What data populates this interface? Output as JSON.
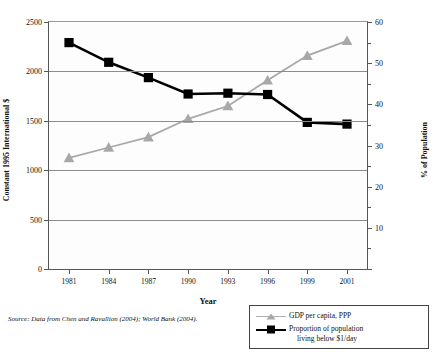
{
  "chart_data": {
    "type": "line",
    "title": "",
    "subtitle": "",
    "xlabel": "Year",
    "ylabel": "Constant 1995 International $",
    "y2label": "% of Population",
    "x": [
      1981,
      1984,
      1987,
      1990,
      1993,
      1996,
      1999,
      2001
    ],
    "categories": [
      "1981",
      "1984",
      "1987",
      "1990",
      "1993",
      "1996",
      "1999",
      "2001"
    ],
    "ylim": [
      0,
      2500
    ],
    "y2lim": [
      0,
      60
    ],
    "yticks": [
      0,
      500,
      1000,
      1500,
      2000,
      2500
    ],
    "yticklabels": [
      "0",
      "500",
      "1000",
      "1500",
      "2000",
      "2500"
    ],
    "y2ticks": [
      0,
      10,
      20,
      30,
      40,
      50,
      60
    ],
    "y2ticklabels": [
      "",
      "10",
      "20",
      "30",
      "40",
      "50",
      "60"
    ],
    "grid": true,
    "legend_position": "below-right",
    "series": [
      {
        "name": "GDP per capita, PPP",
        "axis": "right-value-scale-left",
        "marker": "triangle",
        "color": "#a8a8a8",
        "values": [
          1125,
          1230,
          1335,
          1520,
          1650,
          1910,
          2160,
          2310
        ]
      },
      {
        "name": "Proportion of population living below $1/day",
        "axis": "right",
        "marker": "square",
        "color": "#000000",
        "values": [
          55.0,
          50.2,
          46.5,
          42.5,
          42.7,
          42.4,
          35.6,
          35.2
        ]
      }
    ],
    "source_note": "Source: Data from Chen and Ravallion (2004); World Bank (2004)."
  },
  "legend": {
    "items": [
      {
        "label": "GDP per capita, PPP",
        "label_line2": ""
      },
      {
        "label": "Proportion of population",
        "label_line2": "living below $1/day"
      }
    ]
  }
}
